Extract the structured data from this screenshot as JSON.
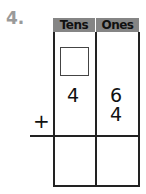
{
  "problem": {
    "number": "4.",
    "headers": {
      "tens": "Tens",
      "ones": "Ones"
    },
    "addend1": {
      "tens": "4",
      "ones": "6"
    },
    "addend2": {
      "tens": "",
      "ones": "4"
    },
    "operator": "+",
    "regroup_box": "",
    "answer": {
      "tens": "",
      "ones": ""
    },
    "colors": {
      "header_bg": "#858585",
      "number": "#9a9a9a",
      "lines": "#222222"
    }
  }
}
